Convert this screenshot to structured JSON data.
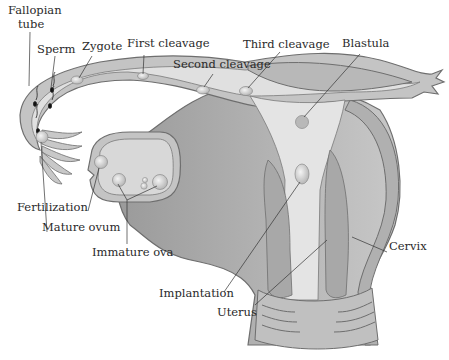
{
  "diagram": {
    "colors": {
      "tissue_dark": "#8f8f8f",
      "tissue_mid": "#b3b3b3",
      "tissue_light": "#d4d4d4",
      "lumen": "#e3e3e3",
      "outline": "#6e6e6e",
      "leader_line": "#333333",
      "text": "#2a2a2a",
      "background": "#ffffff"
    },
    "labels": {
      "fallopian_tube": "Fallopian\ntube",
      "fallopian_tube_line1": "Fallopian",
      "fallopian_tube_line2": "tube",
      "sperm": "Sperm",
      "zygote": "Zygote",
      "first_cleavage": "First cleavage",
      "second_cleavage": "Second cleavage",
      "third_cleavage": "Third cleavage",
      "blastula": "Blastula",
      "fertilization": "Fertilization",
      "mature_ovum": "Mature ovum",
      "immature_ova": "Immature ova",
      "cervix": "Cervix",
      "implantation": "Implantation",
      "uterus": "Uterus"
    }
  }
}
